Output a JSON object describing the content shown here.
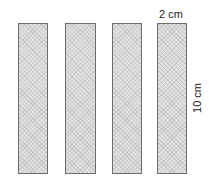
{
  "diagram": {
    "strips": [
      {
        "id": 1,
        "width_cm": 2,
        "height_cm": 10
      },
      {
        "id": 2,
        "width_cm": 2,
        "height_cm": 10
      },
      {
        "id": 3,
        "width_cm": 2,
        "height_cm": 10
      },
      {
        "id": 4,
        "width_cm": 2,
        "height_cm": 10
      }
    ],
    "labels": {
      "width": "2 cm",
      "height": "10 cm"
    },
    "colors": {
      "fill": "#e2e2e2",
      "border": "#6e6e6e",
      "text": "#222222"
    }
  }
}
